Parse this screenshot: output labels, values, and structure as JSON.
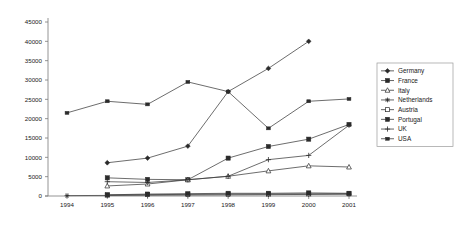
{
  "chart_data": {
    "type": "line",
    "title": "",
    "subtitle": "",
    "xlabel": "",
    "ylabel": "",
    "x": [
      1994,
      1995,
      1996,
      1997,
      1998,
      1999,
      2000,
      2001
    ],
    "categories": [
      "1994",
      "1995",
      "1996",
      "1997",
      "1998",
      "1999",
      "2000",
      "2001"
    ],
    "xticklabels": [
      "1994",
      "1995",
      "1996",
      "1997",
      "1998",
      "1999",
      "2000",
      "2001"
    ],
    "yticklabels": [
      "0",
      "5000",
      "10000",
      "15000",
      "20000",
      "25000",
      "30000",
      "35000",
      "40000",
      "45000"
    ],
    "yticks": [
      0,
      5000,
      10000,
      15000,
      20000,
      25000,
      30000,
      35000,
      40000,
      45000
    ],
    "ylim": [
      0,
      45000
    ],
    "grid": false,
    "legend_position": "right",
    "series": [
      {
        "name": "Germany",
        "marker": "diamond",
        "values": [
          null,
          8600,
          9800,
          12900,
          27000,
          33000,
          40000,
          null
        ]
      },
      {
        "name": "France",
        "marker": "square-filled",
        "values": [
          null,
          4700,
          4300,
          4200,
          9800,
          12800,
          14700,
          18500
        ]
      },
      {
        "name": "Italy",
        "marker": "triangle-open",
        "values": [
          null,
          2600,
          3100,
          4200,
          5100,
          6500,
          7800,
          7500
        ]
      },
      {
        "name": "Netherlands",
        "marker": "star",
        "values": [
          100,
          150,
          200,
          250,
          300,
          350,
          400,
          450
        ]
      },
      {
        "name": "Austria",
        "marker": "square-open",
        "values": [
          null,
          250,
          350,
          420,
          500,
          520,
          560,
          600
        ]
      },
      {
        "name": "Portugal",
        "marker": "square-filled",
        "values": [
          null,
          300,
          500,
          600,
          700,
          700,
          800,
          700
        ]
      },
      {
        "name": "UK",
        "marker": "plus",
        "values": [
          null,
          3700,
          3500,
          4200,
          5100,
          9400,
          10500,
          18300
        ]
      },
      {
        "name": "USA",
        "marker": "dash",
        "values": [
          21500,
          24500,
          23700,
          29500,
          27000,
          17500,
          24500,
          25100
        ]
      }
    ]
  },
  "legend": {
    "items": [
      {
        "label": "Germany"
      },
      {
        "label": "France"
      },
      {
        "label": "Italy"
      },
      {
        "label": "Netherlands"
      },
      {
        "label": "Austria"
      },
      {
        "label": "Portugal"
      },
      {
        "label": "UK"
      },
      {
        "label": "USA"
      }
    ]
  }
}
